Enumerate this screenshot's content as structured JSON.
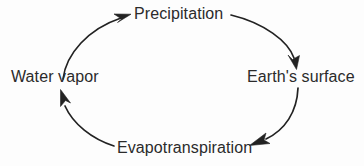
{
  "diagram": {
    "type": "cycle",
    "direction": "clockwise",
    "background_color": "#fdfdfd",
    "stroke_color": "#222222",
    "text_color": "#2b2b2b",
    "nodes": [
      {
        "id": "precipitation",
        "label": "Precipitation",
        "position": "top"
      },
      {
        "id": "earths_surface",
        "label": "Earth's surface",
        "position": "right"
      },
      {
        "id": "evapotranspiration",
        "label": "Evapotranspiration",
        "position": "bottom"
      },
      {
        "id": "water_vapor",
        "label": "Water vapor",
        "position": "left"
      }
    ],
    "arrows": [
      {
        "id": "precipitation-to-earths-surface",
        "from": "Precipitation",
        "to": "Earth's surface",
        "arrowhead": "down"
      },
      {
        "id": "earths-surface-to-evapotranspiration",
        "from": "Earth's surface",
        "to": "Evapotranspiration",
        "arrowhead": "down-left"
      },
      {
        "id": "evapotranspiration-to-water-vapor",
        "from": "Evapotranspiration",
        "to": "Water vapor",
        "arrowhead": "up"
      },
      {
        "id": "water-vapor-to-precipitation",
        "from": "Water vapor",
        "to": "Precipitation",
        "arrowhead": "up-right"
      }
    ]
  }
}
